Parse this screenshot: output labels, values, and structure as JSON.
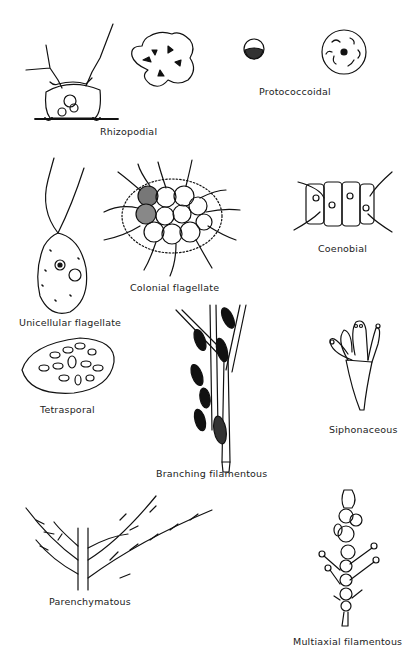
{
  "figure": {
    "labels": {
      "rhizopodial": "Rhizopodial",
      "protococcoidal": "Protococcoidal",
      "unicellular_flagellate": "Unicellular flagellate",
      "colonial_flagellate": "Colonial flagellate",
      "coenobial": "Coenobial",
      "tetrasporal": "Tetrasporal",
      "branching_filamentous": "Branching filamentous",
      "siphonaceous": "Siphonaceous",
      "parenchymatous": "Parenchymatous",
      "multiaxial_filamentous": "Multiaxial filamentous"
    },
    "colors": {
      "ink": "#111111",
      "background": "#ffffff"
    }
  }
}
